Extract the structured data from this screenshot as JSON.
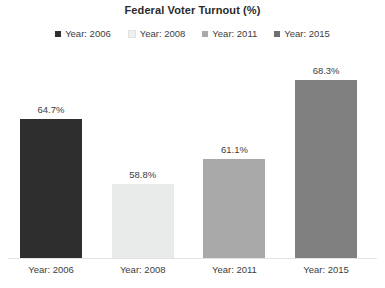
{
  "chart_data": {
    "type": "bar",
    "title": "Federal Voter Turnout (%)",
    "xlabel": "",
    "ylabel": "",
    "categories": [
      "Year: 2006",
      "Year: 2008",
      "Year: 2011",
      "Year: 2015"
    ],
    "values": [
      64.7,
      58.8,
      61.1,
      68.3
    ],
    "value_labels": [
      "64.7%",
      "58.8%",
      "61.1%",
      "68.3%"
    ],
    "series": [
      {
        "name": "Federal Voter Turnout (%)",
        "values": [
          64.7,
          58.8,
          61.1,
          68.3
        ]
      }
    ],
    "bar_colors": [
      "#2e2e2e",
      "#e9ebea",
      "#a9a9a9",
      "#808080"
    ],
    "ylim": [
      52.0,
      70.5
    ],
    "grid": false,
    "axis_visible": false,
    "legend_position": "top",
    "legend": [
      {
        "label": "Year: 2006",
        "color": "#2e2e2e"
      },
      {
        "label": "Year: 2008",
        "color": "#eff1f0"
      },
      {
        "label": "Year: 2011",
        "color": "#a9a9a9"
      },
      {
        "label": "Year: 2015",
        "color": "#6f6f6f"
      }
    ]
  },
  "colors": {
    "background": "#ffffff",
    "text": "#3d3d3d",
    "title": "#2b2b2b",
    "baseline": "#e4e4e4"
  }
}
